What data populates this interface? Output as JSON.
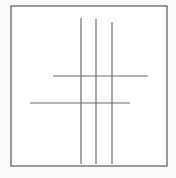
{
  "figure": {
    "title": "Hash grid line drawing",
    "caption": "",
    "background_color": "#fbfbfa",
    "plot_background_color": "#ffffff",
    "line_color": "#6d6d6d",
    "frame_color": "#595959",
    "frame": {
      "x": 11,
      "y": 6,
      "width": 156,
      "height": 160,
      "stroke_width": 1.2
    },
    "vertical_lines": [
      {
        "id": "vertical-line-1",
        "x": 81,
        "y_start": 18,
        "y_end": 164,
        "stroke_width": 1.2
      },
      {
        "id": "vertical-line-2",
        "x": 96,
        "y_start": 19,
        "y_end": 164,
        "stroke_width": 1.2
      },
      {
        "id": "vertical-line-3",
        "x": 112,
        "y_start": 22,
        "y_end": 164,
        "stroke_width": 1.2
      }
    ],
    "horizontal_lines": [
      {
        "id": "horizontal-line-1",
        "y": 76,
        "x_start": 53,
        "x_end": 148,
        "stroke_width": 1.2
      },
      {
        "id": "horizontal-line-2",
        "y": 103,
        "x_start": 30,
        "x_end": 130,
        "stroke_width": 1.2
      }
    ],
    "counts": {
      "vertical": "3",
      "horizontal": "2",
      "intersections": "6"
    }
  },
  "chart_data": {
    "type": "line",
    "title": "Hash grid line drawing",
    "xlabel": "",
    "ylabel": "",
    "xlim": [
      11,
      167
    ],
    "ylim": [
      6,
      166
    ],
    "grid": false,
    "legend": "none",
    "series": [
      {
        "name": "vertical-line-1",
        "x": [
          81,
          81
        ],
        "y": [
          18,
          164
        ]
      },
      {
        "name": "vertical-line-2",
        "x": [
          96,
          96
        ],
        "y": [
          19,
          164
        ]
      },
      {
        "name": "vertical-line-3",
        "x": [
          112,
          112
        ],
        "y": [
          22,
          164
        ]
      },
      {
        "name": "horizontal-line-1",
        "x": [
          53,
          148
        ],
        "y": [
          76,
          76
        ]
      },
      {
        "name": "horizontal-line-2",
        "x": [
          30,
          130
        ],
        "y": [
          103,
          103
        ]
      }
    ],
    "annotations": []
  }
}
